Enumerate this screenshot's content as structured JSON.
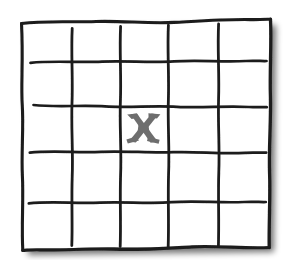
{
  "figure": {
    "type": "hand-drawn-sketch",
    "background_color": "#ffffff",
    "ink_color": "#1c1c1c",
    "mark_color": "#6e6e6e",
    "shadow_color": "#b9b9b9"
  },
  "grid": {
    "rows": 5,
    "columns": 5,
    "interior_vertical_lines": 4,
    "interior_horizontal_lines": 4,
    "border_style": "wobbly-freehand",
    "line_width": 3
  },
  "marks": [
    {
      "glyph": "X",
      "row": 2,
      "column": 3,
      "color": "#6e6e6e",
      "label": "x-mark"
    }
  ],
  "icons": {
    "x_mark": "x-mark-icon",
    "grid": "grid-icon"
  }
}
